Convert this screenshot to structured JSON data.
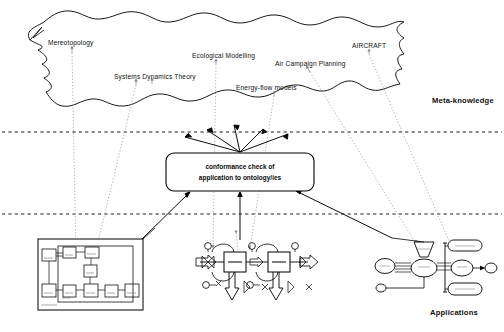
{
  "figure": {
    "layers": [
      {
        "name": "Meta-knowledge",
        "label": "Meta-knowledge"
      },
      {
        "name": "Conformance",
        "label": "conformance check of application to ontology/ies"
      },
      {
        "name": "Applications",
        "label": "Applications"
      }
    ]
  },
  "cloud": {
    "name": "meta-knowledge-cloud",
    "stroke": "#000000",
    "fill": "#ffffff"
  },
  "ontology_labels": [
    {
      "id": "mereotopology",
      "text": "Mereotopology",
      "x": 48,
      "y": 43
    },
    {
      "id": "systems-dynamics-theory",
      "text": "Systems Dynamics Theory",
      "x": 114,
      "y": 77
    },
    {
      "id": "ecological-modelling",
      "text": "Ecological Modelling",
      "x": 192,
      "y": 56
    },
    {
      "id": "air-campaign-planning",
      "text": "Air Campaign Planning",
      "x": 275,
      "y": 64
    },
    {
      "id": "energy-flow-models",
      "text": "Energy-flow models",
      "x": 236,
      "y": 88
    },
    {
      "id": "aircraft",
      "text": "AIRCRAFT",
      "x": 352,
      "y": 46
    }
  ],
  "layer_labels": [
    {
      "id": "meta-knowledge",
      "text": "Meta-knowledge",
      "x": 432,
      "y": 100
    },
    {
      "id": "applications",
      "text": "Applications",
      "x": 430,
      "y": 312
    }
  ],
  "center_box": {
    "name": "conformance-check-box",
    "line1": "conformance check of",
    "line2": "application to ontology/ies",
    "x": 166,
    "y": 153,
    "width": 148,
    "height": 38,
    "radius": 8,
    "stroke": "#000000",
    "fill": "#ffffff"
  },
  "dividers": [
    {
      "id": "divider-upper",
      "y": 132,
      "style": "dashed"
    },
    {
      "id": "divider-lower",
      "y": 214,
      "style": "dashed"
    }
  ],
  "applications": [
    {
      "id": "app-block-diagram",
      "kind": "block-diagram",
      "x": 38,
      "y": 239,
      "width": 105,
      "height": 71
    },
    {
      "id": "app-process-schematic",
      "kind": "process-flow-schematic",
      "x": 193,
      "y": 237,
      "width": 117,
      "height": 68
    },
    {
      "id": "app-network-diagram",
      "kind": "entity-network-diagram",
      "x": 376,
      "y": 236,
      "width": 116,
      "height": 62
    }
  ],
  "colors": {
    "stroke": "#000000",
    "dotted_connector": "#9a9a9a",
    "text": "#101010",
    "background": "#ffffff"
  }
}
